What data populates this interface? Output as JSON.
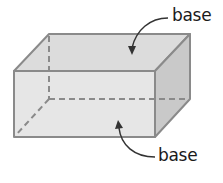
{
  "diagram": {
    "shape": "rectangular prism",
    "labels": [
      {
        "text": "base",
        "target": "top-face"
      },
      {
        "text": "base",
        "target": "bottom-face"
      }
    ],
    "colors": {
      "edge": "#8a8a8a",
      "front_face": "#e4e4e4",
      "top_face": "#dcdcdc",
      "side_face": "#c9c9c9",
      "text": "#1a1a1a"
    }
  }
}
